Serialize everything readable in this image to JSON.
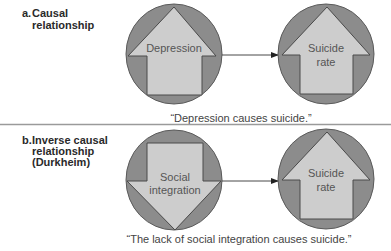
{
  "panels": [
    {
      "label_letter": "a.",
      "label_lines": [
        "Causal",
        "relationship"
      ],
      "cause": {
        "lines": [
          "Depression"
        ],
        "arrow_direction": "up"
      },
      "effect": {
        "lines": [
          "Suicide",
          "rate"
        ],
        "arrow_direction": "up"
      },
      "caption": "“Depression causes suicide.”"
    },
    {
      "label_letter": "b.",
      "label_lines": [
        "Inverse causal",
        "relationship",
        "(Durkheim)"
      ],
      "cause": {
        "lines": [
          "Social",
          "integration"
        ],
        "arrow_direction": "down"
      },
      "effect": {
        "lines": [
          "Suicide",
          "rate"
        ],
        "arrow_direction": "up"
      },
      "caption": "“The lack of social integration causes suicide.”"
    }
  ],
  "colors": {
    "circle_fill": "#8c8c8c",
    "arrow_fill": "#cdcdcd",
    "outline": "#4a4a4a",
    "divider": "#9a9a9a"
  }
}
